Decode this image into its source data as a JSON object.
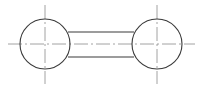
{
  "diagram": {
    "type": "technical-drawing",
    "colors": {
      "background": "#ffffff",
      "outline": "#3a3a3a",
      "centerline": "#8a8a8a"
    },
    "circles": [
      {
        "id": "left",
        "cx": 45,
        "cy": 44,
        "r": 25
      },
      {
        "id": "right",
        "cx": 157,
        "cy": 44,
        "r": 25
      }
    ],
    "connectors": [
      {
        "id": "top",
        "x1": 68,
        "y1": 32,
        "x2": 134,
        "y2": 32
      },
      {
        "id": "bottom",
        "x1": 68,
        "y1": 57,
        "x2": 134,
        "y2": 57
      }
    ],
    "centerlines": {
      "horizontal": {
        "x1": 8,
        "y1": 44,
        "x2": 195,
        "y2": 44
      },
      "vertical": [
        {
          "x": 45,
          "y1": 5,
          "y2": 84
        },
        {
          "x": 157,
          "y1": 5,
          "y2": 84
        }
      ]
    }
  }
}
